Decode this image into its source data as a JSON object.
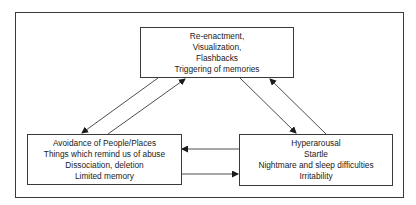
{
  "diagram": {
    "type": "cycle-flow",
    "nodes": [
      {
        "id": "reexperiencing",
        "position": "top",
        "lines": [
          "Re-enactment,",
          "Visualization,",
          "Flashbacks",
          "Triggering of memories"
        ]
      },
      {
        "id": "avoidance",
        "position": "bottom-left",
        "lines": [
          "Avoidance of People/Places",
          "Things which remind us of abuse",
          "Dissociation, deletion",
          "Limited memory"
        ]
      },
      {
        "id": "hyperarousal",
        "position": "bottom-right",
        "lines": [
          "Hyperarousal",
          "Startle",
          "Nightmare and sleep difficulties",
          "Irritability"
        ]
      }
    ],
    "edges": [
      {
        "from": "reexperiencing",
        "to": "avoidance"
      },
      {
        "from": "avoidance",
        "to": "reexperiencing"
      },
      {
        "from": "reexperiencing",
        "to": "hyperarousal"
      },
      {
        "from": "hyperarousal",
        "to": "reexperiencing"
      },
      {
        "from": "hyperarousal",
        "to": "avoidance"
      },
      {
        "from": "avoidance",
        "to": "hyperarousal"
      }
    ],
    "colors": {
      "line": "#3a3a3a",
      "background": "#ffffff",
      "text": "#1a1a1a"
    }
  }
}
